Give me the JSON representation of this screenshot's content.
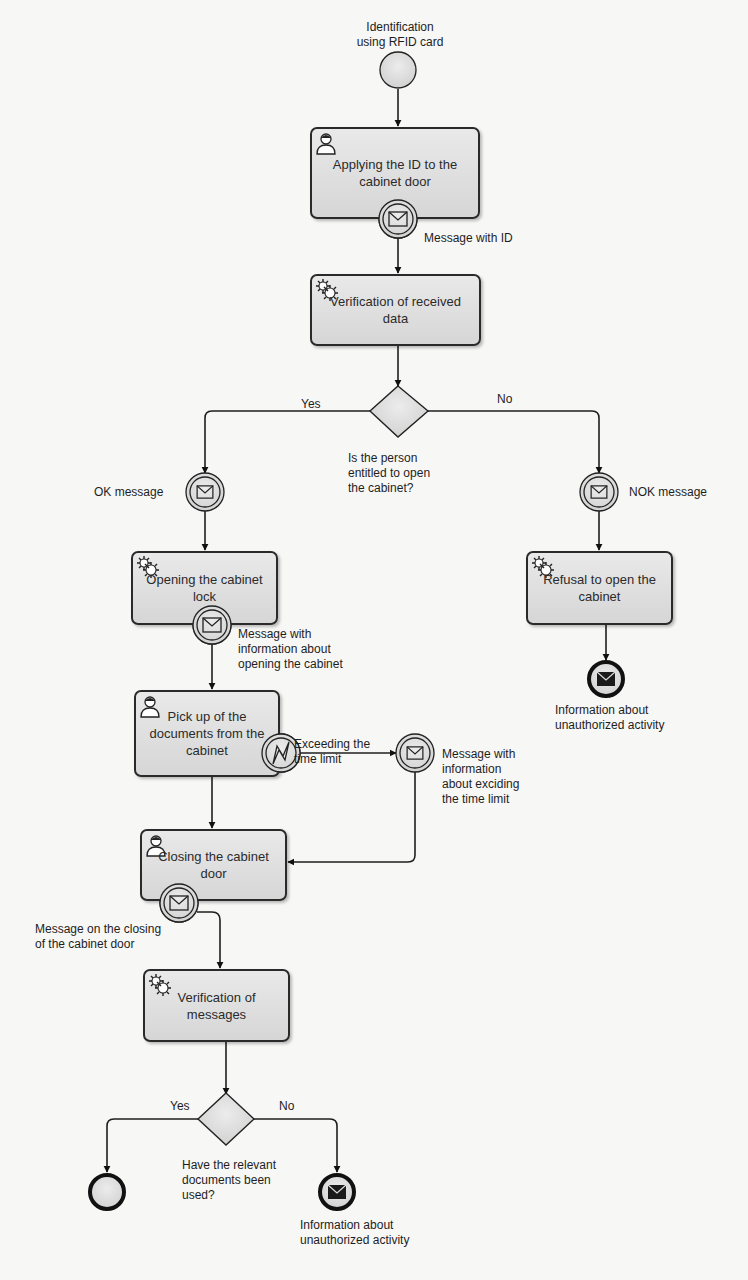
{
  "diagram": {
    "type": "BPMN process",
    "start_event": {
      "label": "Identification\nusing RFID card"
    },
    "tasks": [
      {
        "id": "t1",
        "label": "Applying the ID to the\ncabinet door",
        "type": "user"
      },
      {
        "id": "t2",
        "label": "Verification of received\ndata",
        "type": "service"
      },
      {
        "id": "t3",
        "label": "Opening the cabinet\nlock",
        "type": "service"
      },
      {
        "id": "t4",
        "label": "Refusal to open the\ncabinet",
        "type": "service"
      },
      {
        "id": "t5",
        "label": "Pick up of the\ndocuments from the\ncabinet",
        "type": "user"
      },
      {
        "id": "t6",
        "label": "Closing the cabinet\ndoor",
        "type": "user"
      },
      {
        "id": "t7",
        "label": "Verification of\nmessages",
        "type": "service"
      }
    ],
    "gateways": [
      {
        "id": "g1",
        "label": "Is the person\nentitled to open\nthe cabinet?",
        "yes": "Yes",
        "no": "No"
      },
      {
        "id": "g2",
        "label": "Have the relevant\ndocuments been\nused?",
        "yes": "Yes",
        "no": "No"
      }
    ],
    "message_events": {
      "msg_id": "Message with ID",
      "ok": "OK message",
      "nok": "NOK message",
      "opening": "Message with\ninformation about\nopening the cabinet",
      "timer": "Exceeding the\ntime limit",
      "exceed": "Message with\ninformation\nabout exciding\nthe time limit",
      "closing": "Message on the closing\nof the cabinet door"
    },
    "end_events": {
      "unauth1": "Information about\nunauthorized activity",
      "unauth2": "Information about\nunauthorized activity"
    },
    "colors": {
      "stroke": "#1f1f1f",
      "fill": "#dcdcdc",
      "background": "#f7f7f6"
    }
  }
}
